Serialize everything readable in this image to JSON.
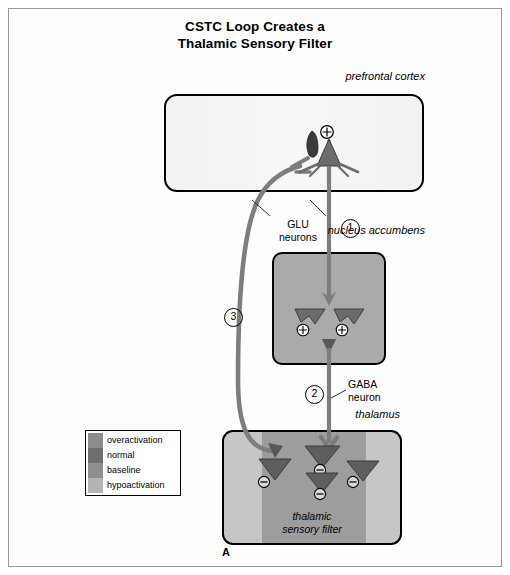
{
  "figure": {
    "title_lines": [
      "CSTC Loop Creates a",
      "Thalamic Sensory Filter"
    ],
    "panel_letter": "A",
    "frame_color": "#9a9a9a"
  },
  "regions": {
    "prefrontal_cortex": {
      "label_lines": [
        "prefrontal",
        "cortex"
      ],
      "fill": "#f4f4f4",
      "neuron": {
        "type": "pyramidal",
        "sign": "⊕",
        "sign_name": "plus-circle"
      }
    },
    "nucleus_accumbens": {
      "label_lines": [
        "nucleus",
        "accumbens"
      ],
      "fill": "#aaaaaa",
      "neurons": [
        {
          "sign": "⊕",
          "sign_name": "plus-circle"
        },
        {
          "sign": "⊕",
          "sign_name": "plus-circle"
        }
      ]
    },
    "thalamus": {
      "label_lines": [
        "thalamus"
      ],
      "fill_outer": "#c6c6c6",
      "fill_band": "#9d9d9d",
      "caption_lines": [
        "thalamic",
        "sensory filter"
      ],
      "neurons": [
        {
          "sign": "⊖",
          "sign_name": "minus-circle"
        },
        {
          "sign": "⊖",
          "sign_name": "minus-circle"
        },
        {
          "sign": "⊖",
          "sign_name": "minus-circle"
        },
        {
          "sign": "⊖",
          "sign_name": "minus-circle"
        }
      ]
    }
  },
  "annotations": {
    "glu": {
      "lines": [
        "GLU",
        "neurons"
      ]
    },
    "gaba": {
      "lines": [
        "GABA",
        "neuron"
      ]
    }
  },
  "steps": [
    {
      "id": "1",
      "label": "1"
    },
    {
      "id": "2",
      "label": "2"
    },
    {
      "id": "3",
      "label": "3"
    }
  ],
  "legend": {
    "items": [
      {
        "label": "overactivation",
        "color": "#8c8c8c"
      },
      {
        "label": "normal",
        "color": "#6e6e6e"
      },
      {
        "label": "baseline",
        "color": "#8f8f8f"
      },
      {
        "label": "hypoactivation",
        "color": "#b4b4b4"
      }
    ]
  },
  "pathway_color": "#7d7d7d",
  "neuron_color": "#575757"
}
